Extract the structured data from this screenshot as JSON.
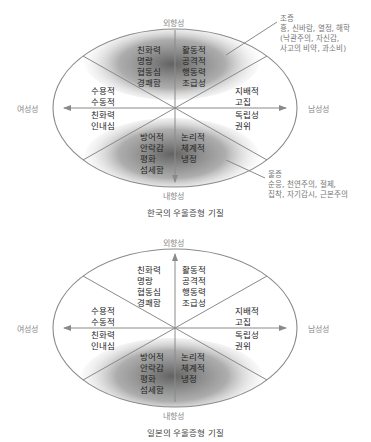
{
  "diagrams": [
    {
      "id": "korea",
      "caption": "한국의 우울증형 기질",
      "axes": {
        "top": "외향성",
        "bottom": "내향성",
        "left": "여성성",
        "right": "남성성"
      },
      "vertical_arrow": "down",
      "shaded_regions": [
        "top",
        "bottom"
      ],
      "regions": {
        "top_left": [
          "친화력",
          "명랑",
          "협동심",
          "경쾌함"
        ],
        "top_right": [
          "활동적",
          "공격적",
          "행동력",
          "조급성"
        ],
        "left_upper": [
          "수용적",
          "수동적"
        ],
        "left_lower": [
          "친화력",
          "인내심"
        ],
        "right_upper": [
          "지배적",
          "고집"
        ],
        "right_lower": [
          "독립성",
          "권위"
        ],
        "bottom_left": [
          "방어적",
          "안락감",
          "평화",
          "섬세함"
        ],
        "bottom_right": [
          "논리적",
          "체계적",
          "냉정"
        ]
      },
      "callouts": {
        "manic": {
          "title": "조증",
          "lines": [
            "흥, 신바람, 열정, 해학",
            "(낙관주의, 자신감,",
            "사고의 비약, 과소비)"
          ]
        },
        "depressive": {
          "title": "울증",
          "lines": [
            "순응, 천연주의, 절제,",
            "집착, 자기감시, 근본주의"
          ]
        }
      }
    },
    {
      "id": "japan",
      "caption": "일본의 우울증형 기질",
      "axes": {
        "top": "외향성",
        "bottom": "내향성",
        "left": "여성성",
        "right": "남성성"
      },
      "vertical_arrow": "up",
      "shaded_regions": [
        "bottom"
      ],
      "regions": {
        "top_left": [
          "친화력",
          "명랑",
          "협동심",
          "경쾌함"
        ],
        "top_right": [
          "활동적",
          "공격적",
          "행동력",
          "조급성"
        ],
        "left_upper": [
          "수용적",
          "수동적"
        ],
        "left_lower": [
          "친화력",
          "인내심"
        ],
        "right_upper": [
          "지배적",
          "고집"
        ],
        "right_lower": [
          "독립성",
          "권위"
        ],
        "bottom_left": [
          "방어적",
          "안락감",
          "평화",
          "섬세함"
        ],
        "bottom_right": [
          "논리적",
          "체계적",
          "냉정"
        ]
      }
    }
  ],
  "colors": {
    "line": "#8a8a8a",
    "shade": "#6e6e6e",
    "text": "#222222",
    "axis_label": "#888888"
  }
}
